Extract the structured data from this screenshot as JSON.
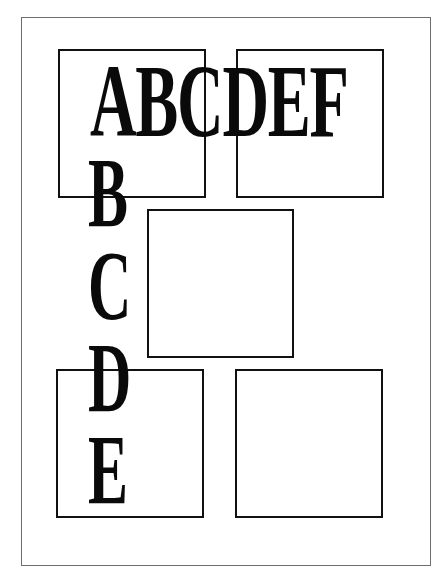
{
  "diagram": {
    "horizontal_text": [
      "A",
      "B",
      "C",
      "D",
      "E",
      "F"
    ],
    "vertical_text": [
      "B",
      "C",
      "D",
      "E"
    ],
    "boxes": [
      {
        "name": "top-left"
      },
      {
        "name": "top-right"
      },
      {
        "name": "center"
      },
      {
        "name": "bottom-left"
      },
      {
        "name": "bottom-right"
      }
    ],
    "colors": {
      "ink": "#0a0a0a",
      "frame": "#6e6e6e",
      "background": "#ffffff"
    }
  }
}
